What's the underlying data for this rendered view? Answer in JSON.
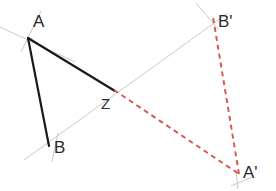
{
  "figure": {
    "width": 276,
    "height": 191,
    "background": "#ffffff",
    "colors": {
      "original": "#1a1a1a",
      "image": "#d4564a",
      "construction": "#c9c9c9",
      "label": "#2b2b2b"
    },
    "labels": {
      "A": "A",
      "B": "B",
      "Z": "Z",
      "A_prime": "A'",
      "B_prime": "B'"
    },
    "points": {
      "A": {
        "x": 28,
        "y": 38
      },
      "B": {
        "x": 49,
        "y": 143
      },
      "Z": {
        "x": 114,
        "y": 90
      },
      "A_prime": {
        "x": 238,
        "y": 173
      },
      "B_prime": {
        "x": 213,
        "y": 20
      }
    },
    "label_positions": {
      "A": {
        "x": 33,
        "y": 27
      },
      "B": {
        "x": 54,
        "y": 153
      },
      "Z": {
        "x": 101,
        "y": 109
      },
      "A_prime": {
        "x": 243,
        "y": 176
      },
      "B_prime": {
        "x": 218,
        "y": 27
      }
    },
    "segments": [
      {
        "name": "segment-A-Z",
        "from": "A",
        "to": "Z",
        "style": "solid",
        "color": "#1a1a1a",
        "width": 2.2
      },
      {
        "name": "segment-A-B",
        "from": "A",
        "to": "B",
        "style": "solid",
        "color": "#1a1a1a",
        "width": 2.2
      },
      {
        "name": "segment-Z-A-prime",
        "from": "Z",
        "to": "A_prime",
        "style": "dashed",
        "color": "#d4564a",
        "width": 1.9
      },
      {
        "name": "segment-A-prime-B-prime",
        "from": "A_prime",
        "to": "B_prime",
        "style": "dashed",
        "color": "#d4564a",
        "width": 1.9
      }
    ],
    "construction_lines": [
      {
        "name": "axis-line-through-B-and-B-prime",
        "x1": 24,
        "y1": 160,
        "x2": 228,
        "y2": 13,
        "color": "#c9c9c9",
        "width": 1.0
      },
      {
        "name": "axis-line-through-A",
        "x1": 0,
        "y1": 27,
        "x2": 75,
        "y2": 62,
        "color": "#c9c9c9",
        "width": 1.0
      },
      {
        "name": "tick-line-at-A",
        "x1": 41,
        "y1": 11,
        "x2": 21,
        "y2": 52,
        "color": "#c9c9c9",
        "width": 1.0
      },
      {
        "name": "tick-line-at-B",
        "x1": 58,
        "y1": 133,
        "x2": 52,
        "y2": 162,
        "color": "#c9c9c9",
        "width": 1.0
      },
      {
        "name": "tick-line-at-B-prime",
        "x1": 196,
        "y1": 3,
        "x2": 219,
        "y2": 30,
        "color": "#c9c9c9",
        "width": 1.0
      },
      {
        "name": "tick-line-at-A-prime",
        "x1": 231,
        "y1": 186,
        "x2": 250,
        "y2": 178,
        "color": "#c9c9c9",
        "width": 1.0
      },
      {
        "name": "tick-line-at-A-prime-2",
        "x1": 236,
        "y1": 170,
        "x2": 238,
        "y2": 188,
        "color": "#c9c9c9",
        "width": 1.0
      }
    ]
  }
}
